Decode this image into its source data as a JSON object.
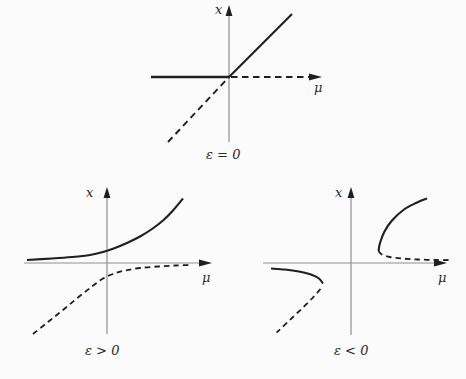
{
  "figure": {
    "width": 466,
    "height": 379,
    "colors": {
      "background": "#fbfbfb",
      "ink": "#1f1f1f",
      "axis": "#8f8f8f",
      "text": "#2b2b2b"
    }
  },
  "plots": [
    {
      "id": "epsilon-zero",
      "labels": {
        "y_label": {
          "text": "x",
          "pos": [
            215,
            3
          ]
        },
        "x_label": {
          "text": "μ",
          "pos": [
            314,
            81
          ]
        },
        "caption": {
          "text": "ε = 0",
          "pos": [
            206,
            148
          ]
        }
      },
      "lines": [
        {
          "name": "p1-y-axis",
          "color": "axis",
          "width": 1.2,
          "points": [
            [
              229,
              142
            ],
            [
              229,
              8
            ]
          ]
        },
        {
          "name": "p1-x-axis-stable-left",
          "color": "ink",
          "width": 2.4,
          "points": [
            [
              151,
              77
            ],
            [
              230,
              77
            ]
          ]
        },
        {
          "name": "p1-x-axis-unstable-right",
          "color": "ink",
          "width": 1.9,
          "dash": "6.5 4.5",
          "points": [
            [
              231,
              77
            ],
            [
              309,
              77
            ]
          ]
        },
        {
          "name": "p1-diagonal-stable",
          "color": "ink",
          "width": 2.1,
          "points": [
            [
              229,
              77
            ],
            [
              292,
              14
            ]
          ]
        },
        {
          "name": "p1-diagonal-unstable",
          "color": "ink",
          "width": 1.9,
          "dash": "6.5 4.5",
          "points": [
            [
              168,
              142
            ],
            [
              228.5,
              77.5
            ]
          ]
        }
      ],
      "arrows": [
        {
          "name": "p1-y-arrowhead",
          "tip": [
            229,
            5
          ],
          "dir": "up",
          "length": 11,
          "halfwidth": 3.4
        },
        {
          "name": "p1-x-arrowhead",
          "tip": [
            322,
            77
          ],
          "dir": "right",
          "length": 13,
          "halfwidth": 3.6
        }
      ]
    },
    {
      "id": "epsilon-positive",
      "labels": {
        "y_label": {
          "text": "x",
          "pos": [
            86,
            186
          ]
        },
        "x_label": {
          "text": "μ",
          "pos": [
            202,
            271
          ]
        },
        "caption": {
          "text": "ε > 0",
          "pos": [
            85,
            344
          ]
        }
      },
      "lines": [
        {
          "name": "p2-y-axis",
          "color": "axis",
          "width": 1.2,
          "points": [
            [
              107,
              334
            ],
            [
              107,
              191
            ]
          ]
        },
        {
          "name": "p2-x-axis",
          "color": "axis",
          "width": 1.2,
          "points": [
            [
              24,
              263
            ],
            [
              200,
              263
            ]
          ]
        },
        {
          "name": "p2-upper-branch-solid",
          "color": "ink",
          "width": 2.1,
          "smooth": true,
          "points": [
            [
              27,
              260
            ],
            [
              52,
              258.5
            ],
            [
              72,
              257
            ],
            [
              90,
              255
            ],
            [
              103,
              252
            ],
            [
              115,
              248
            ],
            [
              128,
              242.5
            ],
            [
              140,
              236.5
            ],
            [
              152,
              229
            ],
            [
              163,
              220.5
            ],
            [
              173,
              210.5
            ],
            [
              183,
              198.5
            ]
          ]
        },
        {
          "name": "p2-lower-branch-dashed",
          "color": "ink",
          "width": 1.8,
          "dash": "5.5 4",
          "smooth": true,
          "points": [
            [
              33,
              334
            ],
            [
              48,
              322
            ],
            [
              63,
              310
            ],
            [
              78,
              297.5
            ],
            [
              92,
              286.5
            ],
            [
              103,
              278.5
            ],
            [
              113,
              274
            ],
            [
              125,
              270.5
            ],
            [
              140,
              268
            ],
            [
              158,
              266.5
            ],
            [
              175,
              265.5
            ],
            [
              191,
              265
            ]
          ]
        }
      ],
      "arrows": [
        {
          "name": "p2-y-arrowhead",
          "tip": [
            107,
            187
          ],
          "dir": "up",
          "length": 11,
          "halfwidth": 3.4
        },
        {
          "name": "p2-x-arrowhead",
          "tip": [
            212,
            263
          ],
          "dir": "right",
          "length": 13,
          "halfwidth": 3.6
        }
      ]
    },
    {
      "id": "epsilon-negative",
      "labels": {
        "y_label": {
          "text": "x",
          "pos": [
            335,
            186
          ]
        },
        "x_label": {
          "text": "μ",
          "pos": [
            438,
            271
          ]
        },
        "caption": {
          "text": "ε < 0",
          "pos": [
            334,
            344
          ]
        }
      },
      "lines": [
        {
          "name": "p3-y-axis",
          "color": "axis",
          "width": 1.2,
          "points": [
            [
              351,
              335
            ],
            [
              351,
              191
            ]
          ]
        },
        {
          "name": "p3-x-axis",
          "color": "axis",
          "width": 1.2,
          "points": [
            [
              263,
              263
            ],
            [
              436,
              263
            ]
          ]
        },
        {
          "name": "p3-right-branch-solid",
          "color": "ink",
          "width": 2.1,
          "smooth": true,
          "points": [
            [
              378.5,
              251
            ],
            [
              380,
              243
            ],
            [
              384.5,
              231.5
            ],
            [
              392,
              220.5
            ],
            [
              404,
              209.5
            ],
            [
              416,
              203
            ],
            [
              427,
              198.5
            ]
          ]
        },
        {
          "name": "p3-right-branch-dashed",
          "color": "ink",
          "width": 1.8,
          "dash": "5.5 4",
          "smooth": true,
          "points": [
            [
              378.5,
              251
            ],
            [
              382,
              254.5
            ],
            [
              390,
              257
            ],
            [
              402,
              258.5
            ],
            [
              418,
              259.5
            ],
            [
              436,
              260
            ],
            [
              452,
              260
            ]
          ]
        },
        {
          "name": "p3-left-branch-solid",
          "color": "ink",
          "width": 2.1,
          "smooth": true,
          "points": [
            [
              271,
              268.5
            ],
            [
              285,
              269.5
            ],
            [
              299,
              271.5
            ],
            [
              311,
              274.5
            ],
            [
              319,
              278.5
            ],
            [
              323,
              283.5
            ]
          ]
        },
        {
          "name": "p3-left-branch-dashed",
          "color": "ink",
          "width": 1.8,
          "dash": "5.5 4",
          "smooth": true,
          "points": [
            [
              320.5,
              289
            ],
            [
              313,
              297.5
            ],
            [
              303,
              307.5
            ],
            [
              292,
              318
            ],
            [
              282,
              327.5
            ],
            [
              276.5,
              332.5
            ]
          ]
        }
      ],
      "arrows": [
        {
          "name": "p3-y-arrowhead",
          "tip": [
            351,
            187
          ],
          "dir": "up",
          "length": 11,
          "halfwidth": 3.4
        },
        {
          "name": "p3-x-arrowhead",
          "tip": [
            447,
            263
          ],
          "dir": "right",
          "length": 13,
          "halfwidth": 3.6
        }
      ]
    }
  ],
  "chart_data": [
    {
      "type": "line",
      "title": "ε = 0",
      "xlabel": "μ",
      "ylabel": "x",
      "xlim": [
        -1.3,
        1.5
      ],
      "ylim": [
        -1.1,
        1.15
      ],
      "grid": false,
      "legend": "none",
      "series": [
        {
          "name": "diagonal x = μ, μ ≥ 0 (solid)",
          "style": "solid",
          "points": [
            [
              0,
              0
            ],
            [
              1.0,
              1.0
            ]
          ]
        },
        {
          "name": "diagonal x = μ, μ ≤ 0 (dashed)",
          "style": "dashed",
          "points": [
            [
              -0.95,
              -0.98
            ],
            [
              0,
              0
            ]
          ]
        },
        {
          "name": "axis branch x = 0, μ ≤ 0 (solid)",
          "style": "solid",
          "points": [
            [
              -1.23,
              0
            ],
            [
              0,
              0
            ]
          ]
        },
        {
          "name": "axis branch x = 0, μ ≥ 0 (dashed)",
          "style": "dashed",
          "points": [
            [
              0,
              0
            ],
            [
              1.3,
              0
            ]
          ]
        }
      ]
    },
    {
      "type": "line",
      "title": "ε > 0",
      "xlabel": "μ",
      "ylabel": "x",
      "xlim": [
        -1.3,
        1.6
      ],
      "ylim": [
        -1.15,
        1.05
      ],
      "grid": false,
      "legend": "none",
      "series": [
        {
          "name": "upper hyperbola branch (solid)",
          "style": "solid",
          "points": [
            [
              -1.23,
              0.05
            ],
            [
              -0.81,
              0.07
            ],
            [
              -0.42,
              0.09
            ],
            [
              -0.11,
              0.13
            ],
            [
              0.13,
              0.19
            ],
            [
              0.36,
              0.28
            ],
            [
              0.59,
              0.42
            ],
            [
              0.8,
              0.58
            ],
            [
              0.98,
              0.78
            ],
            [
              1.19,
              1.0
            ]
          ]
        },
        {
          "name": "lower hyperbola branch (dashed)",
          "style": "dashed",
          "points": [
            [
              -1.16,
              -1.13
            ],
            [
              -0.89,
              -0.92
            ],
            [
              -0.61,
              -0.72
            ],
            [
              -0.34,
              -0.52
            ],
            [
              -0.11,
              -0.33
            ],
            [
              0.08,
              -0.22
            ],
            [
              0.28,
              -0.14
            ],
            [
              0.52,
              -0.09
            ],
            [
              0.8,
              -0.06
            ],
            [
              1.06,
              -0.05
            ],
            [
              1.31,
              -0.04
            ]
          ]
        }
      ]
    },
    {
      "type": "line",
      "title": "ε < 0",
      "xlabel": "μ",
      "ylabel": "x",
      "xlim": [
        -1.4,
        1.6
      ],
      "ylim": [
        -1.15,
        1.05
      ],
      "grid": false,
      "legend": "none",
      "series": [
        {
          "name": "right branch above fold (solid)",
          "style": "solid",
          "points": [
            [
              0.43,
              0.19
            ],
            [
              0.45,
              0.31
            ],
            [
              0.53,
              0.5
            ],
            [
              0.66,
              0.67
            ],
            [
              0.84,
              0.84
            ],
            [
              1.03,
              0.94
            ],
            [
              1.19,
              1.02
            ]
          ]
        },
        {
          "name": "right branch below fold (dashed)",
          "style": "dashed",
          "points": [
            [
              0.43,
              0.19
            ],
            [
              0.47,
              0.14
            ],
            [
              0.58,
              0.1
            ],
            [
              0.73,
              0.08
            ],
            [
              0.98,
              0.06
            ],
            [
              1.28,
              0.05
            ],
            [
              1.56,
              0.05
            ]
          ]
        },
        {
          "name": "left branch above fold (solid)",
          "style": "solid",
          "points": [
            [
              -1.25,
              -0.09
            ],
            [
              -1.03,
              -0.1
            ],
            [
              -0.8,
              -0.13
            ],
            [
              -0.63,
              -0.17
            ],
            [
              -0.5,
              -0.23
            ],
            [
              -0.44,
              -0.31
            ]
          ]
        },
        {
          "name": "left branch below fold (dashed)",
          "style": "dashed",
          "points": [
            [
              -0.48,
              -0.39
            ],
            [
              -0.59,
              -0.53
            ],
            [
              -0.75,
              -0.69
            ],
            [
              -0.92,
              -0.86
            ],
            [
              -1.08,
              -1.0
            ],
            [
              -1.16,
              -1.08
            ]
          ]
        }
      ]
    }
  ]
}
